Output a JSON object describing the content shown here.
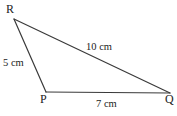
{
  "figure": {
    "type": "triangle-diagram",
    "background_color": "#ffffff",
    "stroke_color": "#3a3a3a",
    "text_color": "#1c1c1c",
    "vertices": [
      {
        "name": "R",
        "label": "R",
        "x": 14,
        "y": 19
      },
      {
        "name": "P",
        "label": "P",
        "x": 46,
        "y": 92
      },
      {
        "name": "Q",
        "label": "Q",
        "x": 170,
        "y": 93
      }
    ],
    "sides": [
      {
        "name": "RQ",
        "label": "10 cm",
        "from": "R",
        "to": "Q",
        "length_value": 10,
        "unit": "cm"
      },
      {
        "name": "RP",
        "label": "5 cm",
        "from": "R",
        "to": "P",
        "length_value": 5,
        "unit": "cm"
      },
      {
        "name": "PQ",
        "label": "7 cm",
        "from": "P",
        "to": "Q",
        "length_value": 7,
        "unit": "cm"
      }
    ]
  }
}
